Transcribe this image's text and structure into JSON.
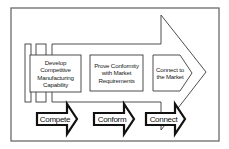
{
  "diagram": {
    "type": "process-arrow",
    "stages": [
      {
        "id": "develop",
        "label": "Develop Competitive Manufacturing Capability",
        "lines": [
          "Develop",
          "Competitive",
          "Manufacturing",
          "Capability"
        ]
      },
      {
        "id": "prove",
        "label": "Prove Conformity with Market Requirements",
        "lines": [
          "Prove Conformity",
          "with Market",
          "Requirements"
        ]
      },
      {
        "id": "connect",
        "label": "Connect to the Market",
        "lines": [
          "Connect to",
          "the Market"
        ]
      }
    ],
    "outcomes": [
      {
        "id": "compete",
        "label": "Compete"
      },
      {
        "id": "conform",
        "label": "Conform"
      },
      {
        "id": "connect",
        "label": "Connect"
      }
    ],
    "colors": {
      "stroke": "#3a3a3a",
      "frame": "#6a6a6a",
      "fill": "#ffffff",
      "text": "#222222"
    }
  }
}
